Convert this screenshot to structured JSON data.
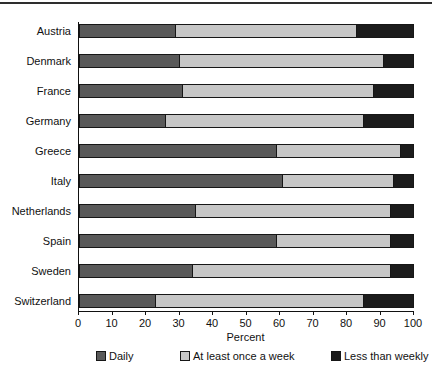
{
  "chart_data": {
    "type": "bar",
    "orientation": "horizontal",
    "stacked": true,
    "title": "",
    "xlabel": "Percent",
    "ylabel": "",
    "xlim": [
      0,
      100
    ],
    "x_ticks": [
      0,
      10,
      20,
      30,
      40,
      50,
      60,
      70,
      80,
      90,
      100
    ],
    "grid": false,
    "legend_position": "bottom",
    "categories": [
      "Austria",
      "Denmark",
      "France",
      "Germany",
      "Greece",
      "Italy",
      "Netherlands",
      "Spain",
      "Sweden",
      "Switzerland"
    ],
    "series": [
      {
        "name": "Daily",
        "color": "#595959",
        "values": [
          29,
          30,
          31,
          26,
          59,
          61,
          35,
          59,
          34,
          23
        ]
      },
      {
        "name": "At least once a week",
        "color": "#c6c6c6",
        "values": [
          54,
          61,
          57,
          59,
          37,
          33,
          58,
          34,
          59,
          62
        ]
      },
      {
        "name": "Less than weekly",
        "color": "#1c1c1c",
        "values": [
          17,
          9,
          12,
          15,
          4,
          6,
          7,
          7,
          7,
          15
        ]
      }
    ]
  },
  "decor": {
    "outline_color": "#161616",
    "top_rule_color": "#2e2e2e"
  },
  "legend": {
    "items": [
      {
        "label": "Daily"
      },
      {
        "label": "At least once a week"
      },
      {
        "label": "Less than weekly"
      }
    ],
    "offsets_px": [
      96,
      180,
      331
    ]
  }
}
